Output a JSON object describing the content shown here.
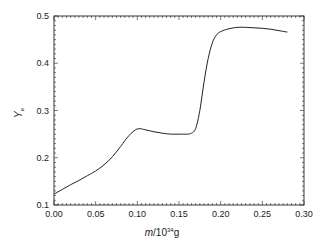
{
  "chart_data": {
    "type": "line",
    "title": "",
    "xlabel": "m/10^34 g",
    "xlabel_parts": {
      "var": "m",
      "base": "/10",
      "exp": "34",
      "unit": "g"
    },
    "ylabel": "Y_e",
    "ylabel_parts": {
      "main": "Y",
      "sub": "e"
    },
    "xlim": [
      0.0,
      0.3
    ],
    "ylim": [
      0.1,
      0.5
    ],
    "xticks": [
      "0.00",
      "0.05",
      "0.10",
      "0.15",
      "0.20",
      "0.25",
      "0.30"
    ],
    "yticks": [
      "0.1",
      "0.2",
      "0.3",
      "0.4",
      "0.5"
    ],
    "grid": false,
    "legend": null,
    "series": [
      {
        "name": "Y_e",
        "color": "#222222",
        "x": [
          0.0,
          0.01,
          0.02,
          0.03,
          0.04,
          0.05,
          0.06,
          0.07,
          0.08,
          0.09,
          0.1,
          0.11,
          0.12,
          0.13,
          0.14,
          0.15,
          0.16,
          0.165,
          0.17,
          0.175,
          0.18,
          0.185,
          0.19,
          0.195,
          0.2,
          0.21,
          0.22,
          0.23,
          0.24,
          0.25,
          0.26,
          0.27,
          0.28
        ],
        "y": [
          0.123,
          0.133,
          0.143,
          0.152,
          0.162,
          0.172,
          0.185,
          0.202,
          0.224,
          0.247,
          0.261,
          0.259,
          0.255,
          0.252,
          0.25,
          0.25,
          0.25,
          0.252,
          0.262,
          0.3,
          0.36,
          0.41,
          0.443,
          0.46,
          0.467,
          0.473,
          0.476,
          0.476,
          0.475,
          0.474,
          0.472,
          0.469,
          0.466
        ]
      }
    ]
  }
}
